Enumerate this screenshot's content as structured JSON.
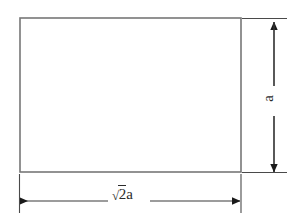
{
  "figure": {
    "kind": "engineering-dimension-drawing",
    "shape": "rectangle",
    "background_color": "#ffffff",
    "shape_outline_color": "#777777",
    "annotation_color": "#2b2b2b"
  },
  "labels": {
    "width": {
      "full_text": "√2a",
      "radical_sign": "√",
      "radicand": "2",
      "variable": "a"
    },
    "height": {
      "full_text": "a",
      "variable": "a",
      "rotation_degrees": -90
    }
  },
  "dimensions": {
    "horizontal": {
      "name": "width-dimension",
      "value_text": "√2a",
      "orientation": "horizontal",
      "arrowheads": "both"
    },
    "vertical": {
      "name": "height-dimension",
      "value_text": "a",
      "orientation": "vertical",
      "arrowheads": "both"
    }
  },
  "geometry": {
    "rect": {
      "x": 20,
      "y": 18,
      "width": 221,
      "height": 154
    },
    "h_dim_line": {
      "y": 201,
      "x1": 19,
      "x2": 240,
      "gap_x1": 108,
      "gap_x2": 148
    },
    "v_dim_line": {
      "x": 274,
      "y1": 22,
      "y2": 172,
      "gap_y1": 86,
      "gap_y2": 116
    },
    "ext_left": {
      "x": 19,
      "y1": 172,
      "y2": 212
    },
    "ext_right": {
      "x": 241,
      "y1": 172,
      "y2": 212
    },
    "ext_top": {
      "y": 18,
      "x1": 241,
      "x2": 286
    },
    "ext_bottom": {
      "y": 172,
      "x1": 241,
      "x2": 286
    }
  }
}
